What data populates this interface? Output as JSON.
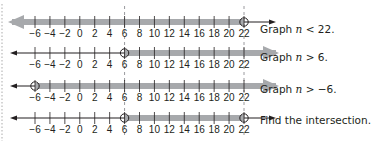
{
  "axis": {
    "min": -6,
    "max": 22,
    "step": 2,
    "tick_labels": [
      "−6",
      "−4",
      "−2",
      "0",
      "2",
      "4",
      "6",
      "8",
      "10",
      "12",
      "14",
      "16",
      "18",
      "20",
      "22"
    ]
  },
  "colors": {
    "line": "#231f20",
    "shade": "#a7a9ac",
    "dashed_guide": "#808285",
    "text": "#231f20",
    "dotted_margin": "#c8c8c8"
  },
  "number_lines": [
    {
      "id": "n-less-22",
      "inequality": "n < 22",
      "shaded_direction": "left",
      "open_circle_at": 22,
      "label": "Graph",
      "var": "n",
      "op": " < ",
      "value": "22."
    },
    {
      "id": "n-greater-6",
      "inequality": "n > 6",
      "shaded_direction": "right",
      "open_circle_at": 6,
      "label": "Graph",
      "var": "n",
      "op": " > ",
      "value": "6."
    },
    {
      "id": "n-greater-neg6",
      "inequality": "n > −6",
      "shaded_direction": "right",
      "open_circle_at": -6,
      "label": "Graph",
      "var": "n",
      "op": " > ",
      "value": "−6."
    },
    {
      "id": "intersection",
      "inequality": "6 < n < 22",
      "shaded_direction": "between",
      "open_circle_at": [
        6,
        22
      ],
      "label": "Find the intersection.",
      "var": "",
      "op": "",
      "value": ""
    }
  ],
  "dashed_guides_at": [
    6,
    22
  ]
}
